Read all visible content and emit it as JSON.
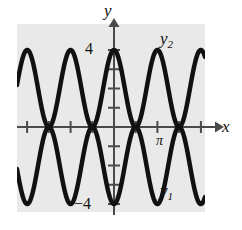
{
  "figure": {
    "kind": "math-graph",
    "background_color": "#ffffff",
    "plot_area_color": "#e9e9e9",
    "curve_color": "#111111",
    "axis_color": "#4a4a4a"
  },
  "labels": {
    "y_axis": "y",
    "x_axis": "x",
    "curve_upper": "y",
    "curve_upper_sub": "2",
    "curve_lower": "y",
    "curve_lower_sub": "1",
    "pi_tick": "π",
    "y_top": "4",
    "y_bottom": "−4"
  },
  "chart_data": {
    "type": "line",
    "title": "",
    "xlabel": "x",
    "ylabel": "y",
    "xlim": [
      -10.2,
      10.2
    ],
    "ylim": [
      -5.6,
      5.6
    ],
    "grid": false,
    "legend": "inline-curve-labels",
    "x_ticks": [
      -9.4248,
      -6.2832,
      -3.1416,
      0,
      3.1416,
      6.2832,
      9.4248
    ],
    "x_tick_labels": [
      "",
      "",
      "",
      "",
      "π",
      "",
      ""
    ],
    "y_ticks": [
      -4,
      -3,
      -2,
      -1,
      1,
      2,
      3,
      4
    ],
    "y_tick_labels": [
      "−4",
      "",
      "",
      "",
      "",
      "",
      "",
      "4"
    ],
    "series": [
      {
        "name": "y2",
        "label": "y₂",
        "expression": "4*cos(x/2)^2",
        "amplitude": 4,
        "period": 6.2832,
        "phase": 0,
        "color": "#111111",
        "linewidth": 4.5,
        "description": "wave with maxima at x = 0, ±2π, ±4π reaching y = 4 and minima near y = 0"
      },
      {
        "name": "y1",
        "label": "y₁",
        "expression": "-4*cos(x/2)^2",
        "amplitude": 4,
        "period": 6.2832,
        "phase": 3.1416,
        "color": "#111111",
        "linewidth": 4.5,
        "description": "mirror wave with minima at x = 0, ±2π, ±4π reaching y = −4"
      }
    ],
    "intersections": [
      {
        "x": -6.2832,
        "y": 0,
        "shape": "lens"
      },
      {
        "x": 0,
        "y": 0,
        "shape": "lens"
      },
      {
        "x": 3.1416,
        "y": 0,
        "shape": "lens"
      }
    ],
    "annotations": [
      {
        "text": "y₂",
        "x": 7.4,
        "y": 4.5,
        "role": "curve-label-upper"
      },
      {
        "text": "y₁",
        "x": 7.4,
        "y": -4.3,
        "role": "curve-label-lower"
      },
      {
        "text": "π",
        "x": 3.1416,
        "y": -0.85,
        "role": "x-tick-label"
      },
      {
        "text": "4",
        "x": -0.75,
        "y": 4,
        "role": "y-tick-label"
      },
      {
        "text": "−4",
        "x": -1.25,
        "y": -4,
        "role": "y-tick-label"
      }
    ]
  }
}
